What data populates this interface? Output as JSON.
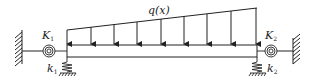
{
  "diagram": {
    "load_label": "q(x)",
    "left_support": {
      "rotational_spring_label": "K",
      "rotational_spring_subscript": "1",
      "translational_spring_label": "k",
      "translational_spring_subscript": "1"
    },
    "right_support": {
      "rotational_spring_label": "K",
      "rotational_spring_subscript": "2",
      "translational_spring_label": "k",
      "translational_spring_subscript": "2"
    },
    "load_arrow_count": 9,
    "colors": {
      "stroke": "#222222",
      "background": "#ffffff"
    }
  }
}
